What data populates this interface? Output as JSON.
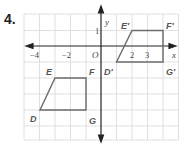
{
  "problem": {
    "number": "4."
  },
  "graph": {
    "axis_labels": {
      "x": "x",
      "y": "y",
      "origin": "O"
    },
    "x_ticks": [
      "−4",
      "−2",
      "2",
      "3"
    ],
    "y_ticks": [
      "1"
    ],
    "colors": {
      "grid": "#d8d8d8",
      "axis": "#222222",
      "shape": "#6b6b6b",
      "label": "#555555"
    },
    "original": {
      "vertices": [
        {
          "name": "D",
          "x": -4,
          "y": -4
        },
        {
          "name": "E",
          "x": -3,
          "y": -2
        },
        {
          "name": "F",
          "x": -1,
          "y": -2
        },
        {
          "name": "G",
          "x": -1,
          "y": -4
        }
      ]
    },
    "image": {
      "vertices": [
        {
          "name": "D′",
          "x": 1,
          "y": -1
        },
        {
          "name": "E′",
          "x": 2,
          "y": 1
        },
        {
          "name": "F′",
          "x": 4,
          "y": 1
        },
        {
          "name": "G′",
          "x": 4,
          "y": -1
        }
      ]
    }
  }
}
